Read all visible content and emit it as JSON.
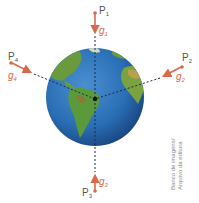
{
  "figure": {
    "colors": {
      "vector": "#d9694a",
      "ocean": "#2a6fb5",
      "land": "#5a9a3a",
      "dashed_line": "#1a2a4a",
      "label": "#555555"
    },
    "points": [
      {
        "id": "P1",
        "label": "P",
        "sub": "1",
        "vector": "g",
        "vector_sub": "1"
      },
      {
        "id": "P2",
        "label": "P",
        "sub": "2",
        "vector": "g",
        "vector_sub": "2"
      },
      {
        "id": "P3",
        "label": "P",
        "sub": "3",
        "vector": "g",
        "vector_sub": "3"
      },
      {
        "id": "P4",
        "label": "P",
        "sub": "4",
        "vector": "g",
        "vector_sub": "4"
      }
    ],
    "credit_line1": "Banco de imagens/",
    "credit_line2": "Arquivo da editora"
  }
}
